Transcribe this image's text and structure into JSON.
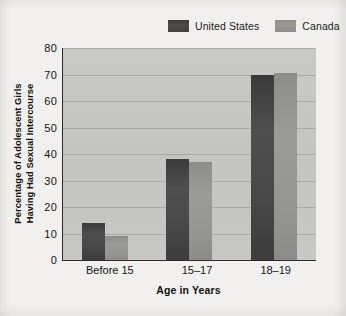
{
  "figure": {
    "background_color": "#f1f0ee",
    "plot_background_color": "#c7c7c3"
  },
  "legend": {
    "position": "top-right",
    "entries": [
      {
        "label": "United States",
        "color": "#454545",
        "swatch_name": "legend-swatch-united-states"
      },
      {
        "label": "Canada",
        "color": "#949491",
        "swatch_name": "legend-swatch-canada"
      }
    ]
  },
  "axes": {
    "y_title_line1": "Percentage of Adolescent Girls",
    "y_title_line2": "Having Had Sexual Intercourse",
    "x_title": "Age in Years",
    "y_ticks": [
      "0",
      "10",
      "20",
      "30",
      "40",
      "50",
      "60",
      "70",
      "80"
    ],
    "x_ticks": [
      "Before 15",
      "15–17",
      "18–19"
    ]
  },
  "chart_data": {
    "type": "bar",
    "title": "",
    "subtitle": "",
    "xlabel": "Age in Years",
    "ylabel": "Percentage of Adolescent Girls Having Had Sexual Intercourse",
    "categories": [
      "Before 15",
      "15–17",
      "18–19"
    ],
    "series": [
      {
        "name": "United States",
        "color": "#454545",
        "values": [
          14,
          38,
          70
        ]
      },
      {
        "name": "Canada",
        "color": "#949491",
        "values": [
          9,
          37,
          70.5
        ]
      }
    ],
    "ylim": [
      0,
      80
    ],
    "ytick_step": 10,
    "grid": true,
    "grid_axis": "y",
    "legend_position": "top-right",
    "bar_group_gap": true
  }
}
